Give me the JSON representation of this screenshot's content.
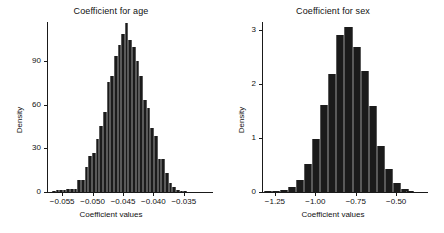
{
  "figure": {
    "background": "#ffffff",
    "bar_color": "#1b1b1b",
    "axis_color": "#1a1a1a"
  },
  "chart_data": [
    {
      "type": "bar",
      "name": "coefficient-for-age",
      "title": "Coefficient for age",
      "xlabel": "Coefficient values",
      "ylabel": "Density",
      "xlim": [
        -0.0575,
        -0.0325
      ],
      "ylim": [
        0,
        117
      ],
      "xticks": [
        -0.055,
        -0.05,
        -0.045,
        -0.04,
        -0.035
      ],
      "xticklabels": [
        "−0.055",
        "−0.050",
        "−0.045",
        "−0.040",
        "−0.035"
      ],
      "yticks": [
        0,
        30,
        60,
        90
      ],
      "yticklabels": [
        "0",
        "30",
        "60",
        "90"
      ],
      "grid": false,
      "legend": "none",
      "bin_width": 0.0006,
      "bin_centers": [
        -0.0564,
        -0.0558,
        -0.0552,
        -0.0546,
        -0.054,
        -0.0534,
        -0.0528,
        -0.0522,
        -0.0516,
        -0.051,
        -0.0504,
        -0.0498,
        -0.0492,
        -0.0486,
        -0.048,
        -0.0474,
        -0.0468,
        -0.0462,
        -0.0456,
        -0.045,
        -0.0444,
        -0.0438,
        -0.0432,
        -0.0426,
        -0.042,
        -0.0414,
        -0.0408,
        -0.0402,
        -0.0396,
        -0.039,
        -0.0384,
        -0.0378,
        -0.0372,
        -0.0366,
        -0.036,
        -0.0354,
        -0.0348
      ],
      "values": [
        0.6,
        1.2,
        1.2,
        1.5,
        2.0,
        2.2,
        2.4,
        8.5,
        8.5,
        17.0,
        24.5,
        27.0,
        36.5,
        45.5,
        55.0,
        75.5,
        80.0,
        93.5,
        101.5,
        108.5,
        116.5,
        104.5,
        99.5,
        90.5,
        80.0,
        63.0,
        57.5,
        44.0,
        38.5,
        23.0,
        22.5,
        13.0,
        6.0,
        3.5,
        1.5,
        0.8,
        0.4
      ]
    },
    {
      "type": "bar",
      "name": "coefficient-for-sex",
      "title": "Coefficient for sex",
      "xlabel": "Coefficient values",
      "ylabel": "Density",
      "xlim": [
        -1.33,
        -0.39
      ],
      "ylim": [
        0,
        3.15
      ],
      "xticks": [
        -1.25,
        -1.0,
        -0.75,
        -0.5
      ],
      "xticklabels": [
        "−1.25",
        "−1.00",
        "−0.75",
        "−0.50"
      ],
      "yticks": [
        0,
        1,
        2,
        3
      ],
      "yticklabels": [
        "0",
        "1",
        "2",
        "3"
      ],
      "grid": false,
      "legend": "none",
      "bin_width": 0.05,
      "bin_centers": [
        -1.295,
        -1.245,
        -1.195,
        -1.145,
        -1.095,
        -1.045,
        -0.995,
        -0.945,
        -0.895,
        -0.845,
        -0.795,
        -0.745,
        -0.695,
        -0.645,
        -0.595,
        -0.545,
        -0.495,
        -0.445,
        -0.415
      ],
      "values": [
        0.01,
        0.02,
        0.03,
        0.09,
        0.23,
        0.52,
        0.98,
        1.61,
        2.19,
        2.9,
        3.05,
        2.69,
        2.25,
        1.6,
        0.86,
        0.42,
        0.17,
        0.05,
        0.02
      ]
    }
  ]
}
